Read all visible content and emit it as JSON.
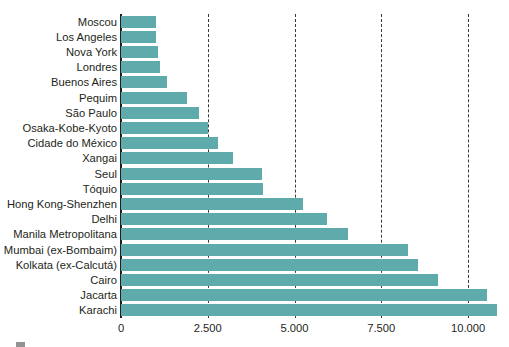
{
  "chart_data": {
    "type": "bar",
    "orientation": "horizontal",
    "title": "",
    "subtitle": "",
    "xlabel": "",
    "ylabel": "",
    "xlim": [
      0,
      11180
    ],
    "grid": true,
    "legend": null,
    "bar_color": "#5fabab",
    "axis_color": "#231f20",
    "gridline_color": "#3a3a3a",
    "gridline_style": "dashed",
    "xticks": [
      0,
      2500,
      5000,
      7500,
      10000
    ],
    "xtick_labels": [
      "0",
      "2.500",
      "5.000",
      "7.500",
      "10.000"
    ],
    "categories": [
      "Moscou",
      "Los Angeles",
      "Nova York",
      "Londres",
      "Buenos Aires",
      "Pequim",
      "São Paulo",
      "Osaka-Kobe-Kyoto",
      "Cidade do México",
      "Xangai",
      "Seul",
      "Tóquio",
      "Hong Kong-Shenzhen",
      "Delhi",
      "Manila Metropolitana",
      "Mumbai (ex-Bombaim)",
      "Kolkata (ex-Calcutá)",
      "Cairo",
      "Jacarta",
      "Karachi"
    ],
    "values": [
      1000,
      1000,
      1080,
      1130,
      1320,
      1900,
      2260,
      2500,
      2800,
      3230,
      4060,
      4100,
      5230,
      5930,
      6550,
      8280,
      8570,
      9140,
      10540,
      10830
    ]
  },
  "corner_mark": {
    "name": "page-artifact-mark"
  }
}
